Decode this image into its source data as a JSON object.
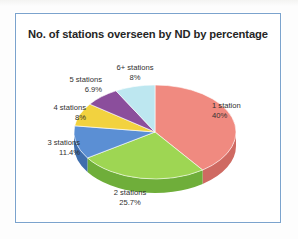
{
  "chart_data": {
    "type": "pie",
    "title": "No. of stations overseen by ND by percentage",
    "xlabel": "",
    "ylabel": "",
    "legend_position": "none",
    "labels_position": "outside",
    "three_d": true,
    "categories": [
      "1 station",
      "2 stations",
      "3 stations",
      "4 stations",
      "5 stations",
      "6+ stations"
    ],
    "values": [
      40,
      25.7,
      11.4,
      8,
      6.9,
      8
    ],
    "value_labels": [
      "40%",
      "25.7%",
      "11.4%",
      "8%",
      "6.9%",
      "8%"
    ],
    "colors": [
      "#f08a80",
      "#9ed653",
      "#5b8fd4",
      "#f2d23f",
      "#8b4e9c",
      "#bde7f0"
    ],
    "side_colors": [
      "#cf6a62",
      "#6fae3a",
      "#3f6ead",
      "#cdae2b",
      "#6a3878",
      "#93c4cf"
    ],
    "slices": [
      {
        "name": "1 station",
        "percent": "40%",
        "value": 40,
        "color": "#f08a80"
      },
      {
        "name": "2 stations",
        "percent": "25.7%",
        "value": 25.7,
        "color": "#9ed653"
      },
      {
        "name": "3 stations",
        "percent": "11.4%",
        "value": 11.4,
        "color": "#5b8fd4"
      },
      {
        "name": "4 stations",
        "percent": "8%",
        "value": 8,
        "color": "#f2d23f"
      },
      {
        "name": "5 stations",
        "percent": "6.9%",
        "value": 6.9,
        "color": "#8b4e9c"
      },
      {
        "name": "6+ stations",
        "percent": "8%",
        "value": 8,
        "color": "#bde7f0"
      }
    ]
  },
  "frame": {
    "border_color": "#7ba3cd",
    "background": "#ffffff"
  }
}
